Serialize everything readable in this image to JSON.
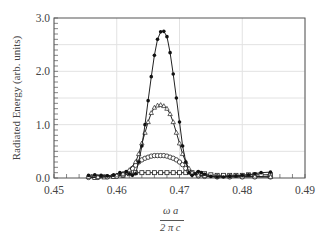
{
  "chart_data": {
    "type": "line",
    "title": "",
    "xlabel_num": "ω a",
    "xlabel_den": "2 π c",
    "ylabel": "Radiated Energy (arb. units)",
    "xlim": [
      0.45,
      0.49
    ],
    "ylim": [
      0,
      3.0
    ],
    "xticks": [
      "0.45",
      "0.46",
      "0.47",
      "0.48",
      "0.49"
    ],
    "yticks": [
      "0.0",
      "1.0",
      "2.0",
      "3.0"
    ],
    "grid": true,
    "legend": "none",
    "series": [
      {
        "name": "filled circles",
        "marker": "filled-circle",
        "x": [
          0.4555,
          0.4565,
          0.4575,
          0.4585,
          0.4595,
          0.4605,
          0.4615,
          0.462,
          0.4625,
          0.463,
          0.4635,
          0.464,
          0.4645,
          0.465,
          0.4655,
          0.466,
          0.4665,
          0.467,
          0.4675,
          0.468,
          0.4685,
          0.469,
          0.4695,
          0.47,
          0.4705,
          0.471,
          0.4715,
          0.472,
          0.4725,
          0.473,
          0.4735,
          0.474,
          0.475,
          0.476,
          0.477,
          0.478,
          0.479,
          0.48,
          0.481,
          0.482,
          0.483,
          0.4845
        ],
        "values": [
          0.05,
          0.06,
          0.05,
          0.04,
          0.06,
          0.1,
          0.12,
          0.08,
          0.05,
          0.08,
          0.3,
          0.6,
          1.0,
          1.45,
          1.9,
          2.3,
          2.6,
          2.74,
          2.75,
          2.65,
          2.35,
          1.95,
          1.5,
          1.05,
          0.6,
          0.3,
          0.1,
          0.05,
          0.08,
          0.12,
          0.1,
          0.07,
          0.03,
          0.02,
          0.02,
          0.03,
          0.04,
          0.05,
          0.06,
          0.08,
          0.1,
          0.11
        ]
      },
      {
        "name": "open triangles",
        "marker": "open-triangle",
        "x": [
          0.4555,
          0.457,
          0.4585,
          0.46,
          0.461,
          0.462,
          0.463,
          0.4635,
          0.464,
          0.4645,
          0.465,
          0.4655,
          0.466,
          0.4665,
          0.467,
          0.4675,
          0.468,
          0.4685,
          0.469,
          0.4695,
          0.47,
          0.4705,
          0.471,
          0.4715,
          0.472,
          0.473,
          0.474,
          0.476,
          0.478,
          0.48,
          0.482,
          0.4845
        ],
        "values": [
          0.02,
          0.02,
          0.03,
          0.05,
          0.08,
          0.15,
          0.3,
          0.45,
          0.65,
          0.85,
          1.05,
          1.22,
          1.32,
          1.36,
          1.37,
          1.35,
          1.3,
          1.2,
          1.05,
          0.85,
          0.65,
          0.45,
          0.3,
          0.18,
          0.1,
          0.05,
          0.04,
          0.03,
          0.03,
          0.03,
          0.03,
          0.02
        ]
      },
      {
        "name": "open circles",
        "marker": "open-circle",
        "x": [
          0.4555,
          0.457,
          0.4585,
          0.46,
          0.461,
          0.462,
          0.4625,
          0.463,
          0.4635,
          0.464,
          0.4645,
          0.465,
          0.4655,
          0.466,
          0.4665,
          0.467,
          0.4675,
          0.468,
          0.4685,
          0.469,
          0.4695,
          0.47,
          0.4705,
          0.471,
          0.4715,
          0.472,
          0.473,
          0.474,
          0.476,
          0.478,
          0.48,
          0.482,
          0.4845
        ],
        "values": [
          0.01,
          0.01,
          0.02,
          0.03,
          0.06,
          0.12,
          0.18,
          0.24,
          0.3,
          0.34,
          0.37,
          0.39,
          0.41,
          0.42,
          0.42,
          0.42,
          0.42,
          0.41,
          0.39,
          0.37,
          0.34,
          0.3,
          0.25,
          0.18,
          0.12,
          0.08,
          0.04,
          0.03,
          0.02,
          0.02,
          0.02,
          0.02,
          0.02
        ]
      },
      {
        "name": "open squares",
        "marker": "open-square",
        "x": [
          0.4565,
          0.458,
          0.4595,
          0.461,
          0.462,
          0.463,
          0.464,
          0.465,
          0.466,
          0.467,
          0.468,
          0.469,
          0.47,
          0.471,
          0.472,
          0.473,
          0.474,
          0.475,
          0.476,
          0.477,
          0.478,
          0.479,
          0.48,
          0.481,
          0.482,
          0.483,
          0.4845
        ],
        "values": [
          0.01,
          0.02,
          0.03,
          0.05,
          0.08,
          0.1,
          0.1,
          0.1,
          0.1,
          0.1,
          0.1,
          0.1,
          0.1,
          0.1,
          0.1,
          0.09,
          0.08,
          0.06,
          0.05,
          0.05,
          0.05,
          0.05,
          0.05,
          0.06,
          0.06,
          0.06,
          0.06
        ]
      }
    ]
  }
}
